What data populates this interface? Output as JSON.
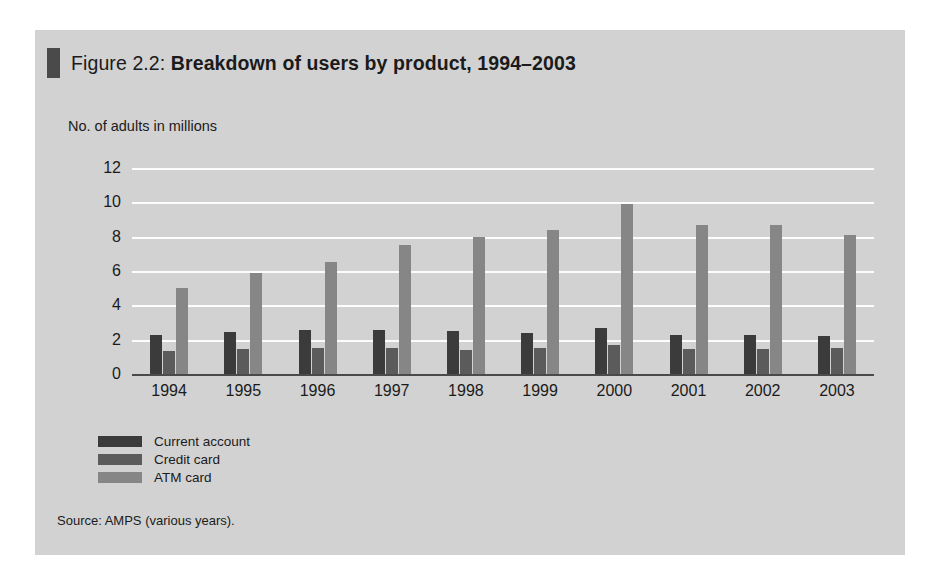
{
  "figure": {
    "label": "Figure 2.2:",
    "title": "Breakdown of users by product, 1994–2003",
    "source": "Source: AMPS (various years).",
    "marker_color": "#4a4a4a",
    "panel_color": "#d2d2d2"
  },
  "chart_data": {
    "type": "bar",
    "title": "Breakdown of users by product, 1994–2003",
    "xlabel": "",
    "ylabel": "No. of adults in millions",
    "ylim": [
      0,
      12
    ],
    "yticks": [
      "0",
      "2",
      "4",
      "6",
      "8",
      "10",
      "12"
    ],
    "grid": true,
    "legend_position": "bottom-left",
    "categories": [
      "1994",
      "1995",
      "1996",
      "1997",
      "1998",
      "1999",
      "2000",
      "2001",
      "2002",
      "2003"
    ],
    "series": [
      {
        "name": "Current account",
        "color": "#3b3b3b",
        "values": [
          2.3,
          2.45,
          2.55,
          2.55,
          2.5,
          2.4,
          2.7,
          2.3,
          2.3,
          2.2
        ]
      },
      {
        "name": "Credit card",
        "color": "#5b5b5b",
        "values": [
          1.35,
          1.45,
          1.5,
          1.5,
          1.4,
          1.5,
          1.7,
          1.45,
          1.45,
          1.5
        ]
      },
      {
        "name": "ATM card",
        "color": "#868686",
        "values": [
          5.0,
          5.9,
          6.5,
          7.5,
          8.0,
          8.4,
          9.9,
          8.7,
          8.7,
          8.1
        ]
      }
    ]
  }
}
